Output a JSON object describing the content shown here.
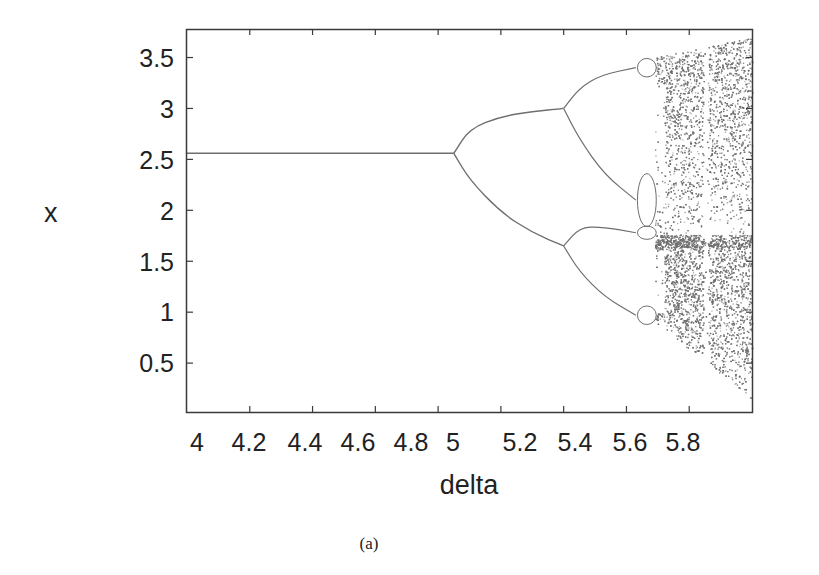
{
  "figure": {
    "caption": "(a)"
  },
  "chart_data": {
    "type": "scatter",
    "title": "",
    "subtitle": "Bifurcation diagram",
    "xlabel": "delta",
    "ylabel": "x",
    "xlim": [
      4.0,
      5.8
    ],
    "ylim": [
      0.02,
      3.78
    ],
    "grid": false,
    "legend": null,
    "xticks": [
      4,
      4.2,
      4.4,
      4.6,
      4.8,
      5,
      5.2,
      5.4,
      5.6,
      5.8
    ],
    "xtick_labels": [
      "4",
      "4.2",
      "4.4",
      "4.6",
      "4.8",
      "5",
      "5.2",
      "5.4",
      "5.6",
      "5.8"
    ],
    "yticks": [
      0.5,
      1,
      1.5,
      2,
      2.5,
      3,
      3.5
    ],
    "ytick_labels": [
      "0.5",
      "1",
      "1.5",
      "2",
      "2.5",
      "3",
      "3.5"
    ],
    "point_color": "#6e6e6e",
    "fixed_point": {
      "delta_range": [
        4.0,
        4.85
      ],
      "x": 2.56
    },
    "period2_branches": [
      {
        "name": "upper",
        "points": [
          [
            4.85,
            2.56
          ],
          [
            4.9,
            2.8
          ],
          [
            5.0,
            2.92
          ],
          [
            5.1,
            2.97
          ],
          [
            5.2,
            3.0
          ]
        ]
      },
      {
        "name": "lower",
        "points": [
          [
            4.85,
            2.56
          ],
          [
            4.9,
            2.3
          ],
          [
            5.0,
            1.98
          ],
          [
            5.1,
            1.78
          ],
          [
            5.2,
            1.65
          ]
        ]
      }
    ],
    "period4_branches": [
      {
        "name": "p4-a",
        "points": [
          [
            5.2,
            3.0
          ],
          [
            5.25,
            3.2
          ],
          [
            5.32,
            3.33
          ],
          [
            5.43,
            3.4
          ]
        ]
      },
      {
        "name": "p4-b",
        "points": [
          [
            5.2,
            3.0
          ],
          [
            5.25,
            2.7
          ],
          [
            5.33,
            2.35
          ],
          [
            5.43,
            2.1
          ]
        ]
      },
      {
        "name": "p4-c",
        "points": [
          [
            5.2,
            1.65
          ],
          [
            5.25,
            1.83
          ],
          [
            5.32,
            1.84
          ],
          [
            5.43,
            1.78
          ]
        ]
      },
      {
        "name": "p4-d",
        "points": [
          [
            5.2,
            1.65
          ],
          [
            5.25,
            1.4
          ],
          [
            5.33,
            1.15
          ],
          [
            5.43,
            0.97
          ]
        ]
      }
    ],
    "chaos_onset_delta": 5.49,
    "chaos_envelope": {
      "upper": [
        [
          5.49,
          3.5
        ],
        [
          5.8,
          3.7
        ]
      ],
      "lower": [
        [
          5.49,
          0.9
        ],
        [
          5.8,
          0.15
        ]
      ]
    },
    "periodic_window_delta": [
      5.645,
      5.66
    ]
  }
}
